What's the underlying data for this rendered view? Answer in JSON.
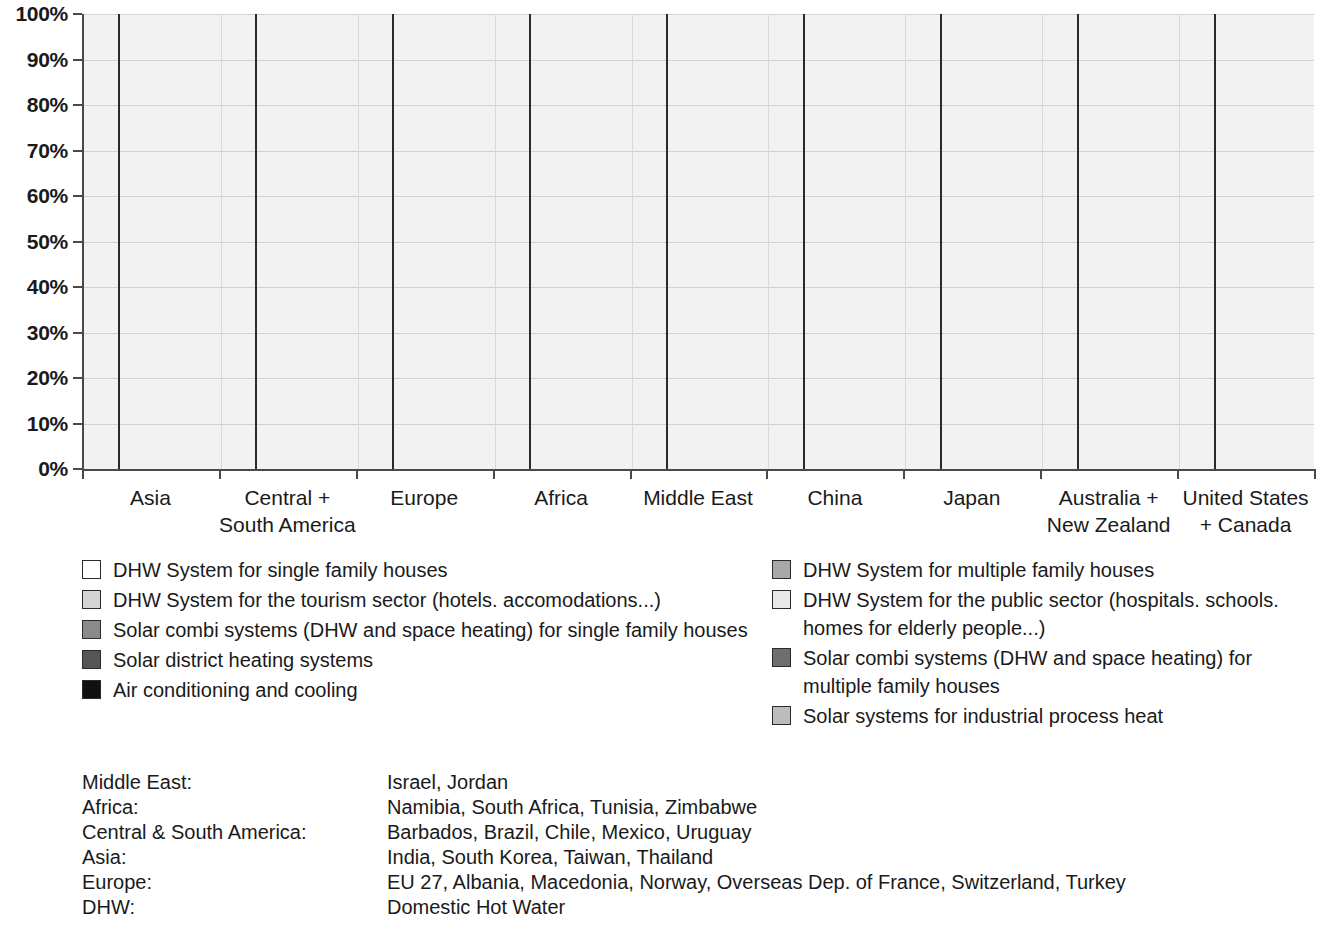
{
  "chart_data": {
    "type": "bar",
    "subtype": "stacked-percentage",
    "title": "",
    "xlabel": "",
    "ylabel": "",
    "ylim": [
      0,
      100
    ],
    "grid": true,
    "legend_position": "below",
    "y_ticks": [
      "0%",
      "10%",
      "20%",
      "30%",
      "40%",
      "50%",
      "60%",
      "70%",
      "80%",
      "90%",
      "100%"
    ],
    "categories": [
      "Asia",
      "Central +\nSouth America",
      "Europe",
      "Africa",
      "Middle East",
      "China",
      "Japan",
      "Australia +\nNew Zealand",
      "United States\n+ Canada"
    ],
    "series": [
      {
        "name": "DHW System for single family houses",
        "color": "#ffffff",
        "values": [
          80.5,
          82.5,
          83.0,
          85.0,
          88.5,
          89.5,
          95.0,
          96.0,
          97.0
        ]
      },
      {
        "name": "DHW System for multiple family houses",
        "color": "#a8a8a8",
        "values": [
          5.5,
          15.0,
          5.5,
          2.5,
          6.5,
          7.0,
          4.0,
          3.0,
          2.0
        ]
      },
      {
        "name": "DHW System for the tourism sector (hotels. accomodations...)",
        "color": "#d4d4d4",
        "values": [
          4.5,
          0.8,
          1.5,
          3.0,
          4.0,
          0.8,
          0.0,
          0.0,
          0.0
        ]
      },
      {
        "name": "DHW System for the public sector (hospitals. schools. homes for elderly people...)",
        "color": "#e8e8e8",
        "values": [
          8.0,
          0.5,
          2.5,
          5.5,
          0.0,
          1.0,
          0.0,
          0.0,
          0.0
        ]
      },
      {
        "name": "Solar combi systems (DHW and space heating) for single family houses",
        "color": "#8a8a8a",
        "values": [
          0.0,
          0.3,
          7.0,
          3.0,
          0.0,
          0.5,
          0.5,
          0.0,
          0.0
        ]
      },
      {
        "name": "Solar combi systems (DHW and space heating) for multiple family houses",
        "color": "#6e6e6e",
        "values": [
          0.0,
          0.3,
          0.0,
          0.5,
          0.0,
          0.5,
          0.0,
          0.0,
          0.0
        ]
      },
      {
        "name": "Solar district heating systems",
        "color": "#565656",
        "values": [
          0.8,
          0.3,
          0.3,
          0.3,
          0.5,
          0.5,
          0.3,
          0.5,
          0.5
        ]
      },
      {
        "name": "Solar systems for industrial process heat",
        "color": "#bcbcbc",
        "values": [
          0.4,
          0.2,
          0.1,
          0.1,
          0.3,
          0.1,
          0.1,
          0.4,
          0.4
        ]
      },
      {
        "name": "Air conditioning and cooling",
        "color": "#111111",
        "values": [
          0.3,
          0.1,
          0.1,
          0.1,
          0.2,
          0.1,
          0.1,
          0.1,
          0.1
        ]
      }
    ]
  },
  "legend": {
    "left": [
      {
        "label": "DHW System for single family houses",
        "color": "#ffffff"
      },
      {
        "label": "DHW System for the tourism sector (hotels. accomodations...)",
        "color": "#d4d4d4"
      },
      {
        "label": "Solar combi systems (DHW and space heating) for single family houses",
        "color": "#8a8a8a"
      },
      {
        "label": "Solar district heating systems",
        "color": "#565656"
      },
      {
        "label": "Air conditioning and cooling",
        "color": "#111111"
      }
    ],
    "right": [
      {
        "label": "DHW System for multiple family houses",
        "color": "#a8a8a8"
      },
      {
        "label": "DHW System for the public sector (hospitals. schools. homes for elderly people...)",
        "color": "#e8e8e8"
      },
      {
        "label": "Solar combi systems (DHW and space heating) for multiple family houses",
        "color": "#6e6e6e"
      },
      {
        "label": "Solar systems for industrial process heat",
        "color": "#bcbcbc"
      }
    ]
  },
  "notes": [
    {
      "key": "Middle East:",
      "value": "Israel, Jordan"
    },
    {
      "key": "Africa:",
      "value": "Namibia, South Africa, Tunisia, Zimbabwe"
    },
    {
      "key": "Central & South America:",
      "value": "Barbados, Brazil, Chile, Mexico, Uruguay"
    },
    {
      "key": "Asia:",
      "value": "India, South Korea, Taiwan, Thailand"
    },
    {
      "key": "Europe:",
      "value": "EU 27, Albania, Macedonia, Norway, Overseas Dep. of France, Switzerland, Turkey"
    },
    {
      "key": "DHW:",
      "value": "Domestic Hot Water"
    }
  ]
}
